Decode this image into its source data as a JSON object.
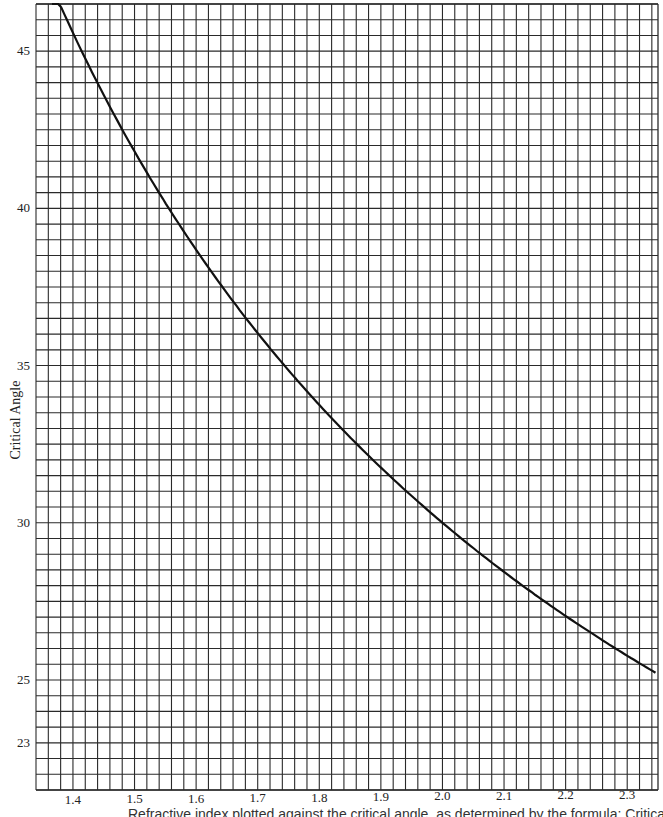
{
  "chart_data": {
    "type": "line",
    "title": "",
    "xlabel": "",
    "ylabel": "Critical Angle",
    "xlim": [
      1.34,
      2.35
    ],
    "ylim": [
      21.5,
      46.5
    ],
    "grid": true,
    "grid_x_step": 0.02,
    "grid_y_step": 0.5,
    "x_ticks": [
      1.4,
      1.5,
      1.6,
      1.7,
      1.8,
      1.9,
      2.0,
      2.1,
      2.2,
      2.3
    ],
    "x_tick_labels": [
      "1.4",
      "1.5",
      "1.6",
      "1.7",
      "1.8",
      "1.9",
      "2.0",
      "2.1",
      "2.2",
      "2.3"
    ],
    "y_ticks": [
      45,
      40,
      35,
      30,
      25,
      23
    ],
    "y_tick_labels": [
      "45",
      "40",
      "35",
      "30",
      "25",
      "23"
    ],
    "series": [
      {
        "name": "Critical angle = arcsin(1/n)",
        "x": [
          1.37,
          1.4,
          1.45,
          1.5,
          1.55,
          1.6,
          1.65,
          1.7,
          1.75,
          1.8,
          1.85,
          1.9,
          1.95,
          2.0,
          2.05,
          2.1,
          2.15,
          2.2,
          2.25,
          2.3,
          2.35
        ],
        "values": [
          46.9,
          45.6,
          43.6,
          41.8,
          40.2,
          38.7,
          37.3,
          36.0,
          34.8,
          33.7,
          32.7,
          31.8,
          30.9,
          30.0,
          29.2,
          28.4,
          27.7,
          27.0,
          26.4,
          25.8,
          25.2
        ]
      }
    ],
    "legend": null
  },
  "caption": {
    "text": "Refractive index plotted against the critical angle, as determined by the formula: Critical angle = arcsin"
  },
  "style": {
    "grid_color": "#2a2a2a",
    "curve_color": "#111111",
    "background": "#ffffff"
  }
}
